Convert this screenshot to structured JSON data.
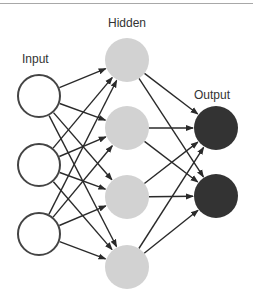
{
  "diagram": {
    "type": "feedforward-neural-network",
    "colors": {
      "input_fill": "#ffffff",
      "input_stroke": "#444444",
      "hidden_fill": "#d2d2d2",
      "output_fill": "#333333",
      "edge": "#2a2a2a",
      "rule": "#a8a8a8",
      "label": "#333333"
    },
    "layers": [
      {
        "label": "Input",
        "label_pos": [
          22,
          63
        ],
        "nodes": [
          {
            "id": "i1",
            "cx": 39,
            "cy": 96
          },
          {
            "id": "i2",
            "cx": 39,
            "cy": 165
          },
          {
            "id": "i3",
            "cx": 39,
            "cy": 234
          }
        ]
      },
      {
        "label": "Hidden",
        "label_pos": [
          108,
          27
        ],
        "nodes": [
          {
            "id": "h1",
            "cx": 127,
            "cy": 60
          },
          {
            "id": "h2",
            "cx": 127,
            "cy": 128
          },
          {
            "id": "h3",
            "cx": 127,
            "cy": 197
          },
          {
            "id": "h4",
            "cx": 127,
            "cy": 267
          }
        ]
      },
      {
        "label": "Output",
        "label_pos": [
          194,
          99
        ],
        "nodes": [
          {
            "id": "o1",
            "cx": 216,
            "cy": 128
          },
          {
            "id": "o2",
            "cx": 216,
            "cy": 196
          }
        ]
      }
    ],
    "node_radius": 22,
    "connections": "fully-connected, directed left-to-right with arrowheads"
  }
}
